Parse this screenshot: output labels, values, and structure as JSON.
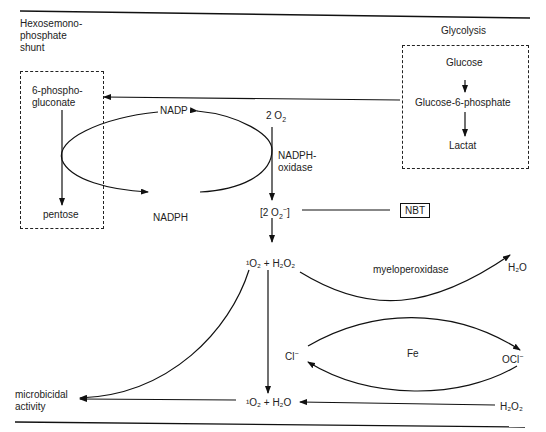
{
  "sections": {
    "left_title": [
      "Hexosemono-",
      "phosphate",
      "shunt"
    ],
    "right_title": "Glycolysis"
  },
  "hmp_box": {
    "top": [
      "6-phospho-",
      "gluconate"
    ],
    "bottom": "pentose"
  },
  "glycolysis_box": {
    "items": [
      "Glucose",
      "Glucose-6-phosphate",
      "Lactat"
    ]
  },
  "cycle": {
    "nadp": "NADP",
    "nadph": "NADPH",
    "o2_top": "2 O",
    "o2_sub": "2",
    "enzyme": [
      "NADPH-",
      "oxidase"
    ],
    "superoxide": "[2 O",
    "superoxide_sub": "2",
    "superoxide_sup": "−",
    "superoxide_close": "]"
  },
  "nbt": "NBT",
  "products": {
    "singlet_h2o2": "¹O₂ + H₂O₂",
    "myeloperoxidase": "myeloperoxidase",
    "h2o_right": "H₂O",
    "cl": "Cl",
    "cl_sup": "−",
    "fe": "Fe",
    "ocl": "OCl",
    "ocl_sup": "−",
    "singlet_h2o": "¹O₂ + H₂O",
    "h2o2_bottom": "H₂O₂",
    "microbicidal": [
      "microbicidal",
      "activity"
    ]
  }
}
